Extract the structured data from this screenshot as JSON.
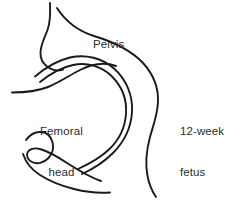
{
  "figure": {
    "title_visible": false,
    "background_color": "#ffffff",
    "stroke_color": "#1a1a1a",
    "text_color": "#2b2b2b",
    "labels": [
      {
        "id": "pelvis",
        "text": "Pelvis"
      },
      {
        "id": "femoral_head",
        "line1": "Femoral",
        "line2": "head"
      },
      {
        "id": "fetus",
        "line1": "12-week",
        "line2": "fetus"
      }
    ],
    "structures": [
      {
        "name": "iliac-crest-neck",
        "description": "narrow upper-left neck of pelvis"
      },
      {
        "name": "pelvis-outer-contour",
        "description": "outer body wall curving down the right side"
      },
      {
        "name": "acetabulum-outer-arc",
        "description": "outer arc of the acetabular cup"
      },
      {
        "name": "acetabulum-inner-arc",
        "description": "inner arc of the acetabular cup around femoral head"
      },
      {
        "name": "femur-upper-line",
        "description": "upper edge of the femoral shaft / limb bud"
      },
      {
        "name": "femur-lower-line",
        "description": "lower edge of the femoral shaft / limb bud"
      },
      {
        "name": "superior-pelvic-line",
        "description": "horizontal line at left forming superior pelvic border"
      }
    ]
  }
}
